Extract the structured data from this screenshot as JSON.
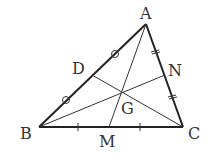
{
  "diagram": {
    "type": "triangle-medians",
    "points": {
      "A": {
        "label": "A",
        "x": 146,
        "y": 24
      },
      "B": {
        "label": "B",
        "x": 39,
        "y": 127
      },
      "C": {
        "label": "C",
        "x": 183,
        "y": 127
      },
      "D": {
        "label": "D",
        "x": 92,
        "y": 75
      },
      "N": {
        "label": "N",
        "x": 165,
        "y": 75
      },
      "M": {
        "label": "M",
        "x": 109,
        "y": 127
      },
      "G": {
        "label": "G",
        "x": 121,
        "y": 92
      }
    },
    "labels": {
      "A": "A",
      "B": "B",
      "C": "C",
      "D": "D",
      "N": "N",
      "M": "M",
      "G": "G"
    },
    "markings": {
      "AB": "circle marks (AD = DB)",
      "AC": "double tick marks (AN = NC)",
      "BC": "single tick marks (BM = MC)"
    },
    "colors": {
      "stroke": "#222222",
      "text": "#333333"
    }
  }
}
